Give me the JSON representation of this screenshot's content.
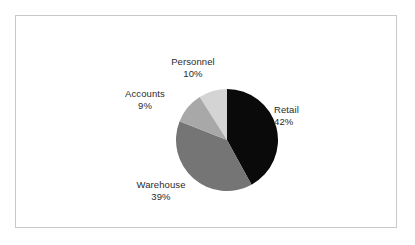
{
  "figure": {
    "background_color": "#ffffff",
    "border_color": "#c9c9c9"
  },
  "chart_data": {
    "type": "pie",
    "title": "",
    "subtitle": "",
    "xlabel": "",
    "ylabel": "",
    "grid": false,
    "legend_position": "none",
    "label_format": "name-and-percent",
    "start_angle_deg": 0,
    "direction": "clockwise",
    "categories": [
      "Retail",
      "Warehouse",
      "Personnel",
      "Accounts"
    ],
    "values": [
      42,
      39,
      10,
      9
    ],
    "units": "percent",
    "total": 100,
    "slices": [
      {
        "name": "Retail",
        "percent": 10,
        "value": 42,
        "label_name": "Retail",
        "label_value": "42%",
        "color": "#0a0a0a",
        "start_deg": 0,
        "end_deg": 151.2
      },
      {
        "name": "Warehouse",
        "value": 39,
        "label_name": "Warehouse",
        "label_value": "39%",
        "color": "#757575",
        "start_deg": 151.2,
        "end_deg": 291.6
      },
      {
        "name": "Accounts",
        "value": 9,
        "label_name": "Accounts",
        "label_value": "9%",
        "color": "#d4d4d4",
        "start_deg": 291.6,
        "end_deg": 324.0
      },
      {
        "name": "Personnel",
        "value": 10,
        "label_name": "Personnel",
        "label_value": "10%",
        "color": "#a8a8a8",
        "start_deg": 324.0,
        "end_deg": 360.0
      }
    ]
  },
  "labels": {
    "personnel": {
      "name": "Personnel",
      "value": "10%"
    },
    "accounts": {
      "name": "Accounts",
      "value": "9%"
    },
    "retail": {
      "name": "Retail",
      "value": "42%"
    },
    "warehouse": {
      "name": "Warehouse",
      "value": "39%"
    }
  }
}
